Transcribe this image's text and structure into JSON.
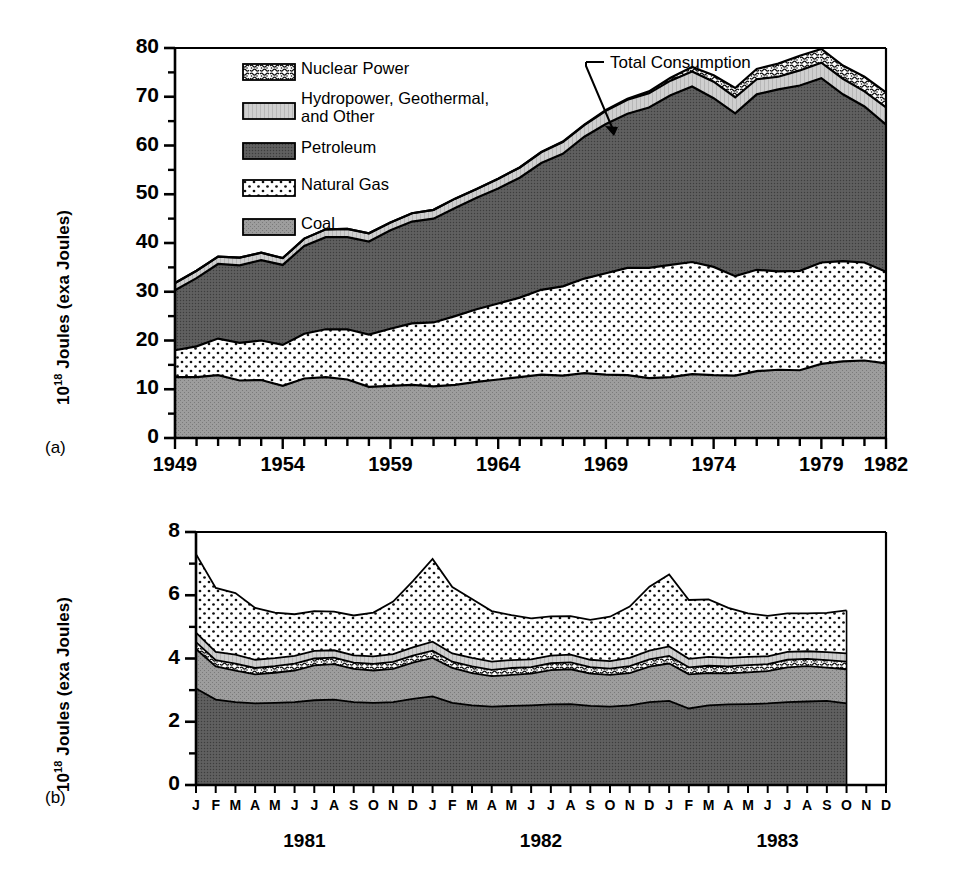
{
  "figure": {
    "panels": [
      {
        "id": "a",
        "label": "(a)"
      },
      {
        "id": "b",
        "label": "(b)"
      }
    ]
  },
  "legend": {
    "items": [
      {
        "key": "nuclear",
        "label": "Nuclear Power",
        "pattern": "speckle",
        "color": "#ffffff"
      },
      {
        "key": "hydro",
        "label": "Hydropower, Geothermal,",
        "label2": "and Other",
        "pattern": "vlines",
        "color": "#d0d0d0"
      },
      {
        "key": "petroleum",
        "label": "Petroleum",
        "pattern": "dense-dark",
        "color": "#555555"
      },
      {
        "key": "gas",
        "label": "Natural Gas",
        "pattern": "dots",
        "color": "#ffffff"
      },
      {
        "key": "coal",
        "label": "Coal",
        "pattern": "mid-gray",
        "color": "#9a9a9a"
      }
    ]
  },
  "annotations": {
    "total_consumption": "Total Consumption"
  },
  "chart_data": [
    {
      "type": "area",
      "panel": "a",
      "title": "",
      "xlabel": "",
      "ylabel": "10¹⁸ Joules (exa Joules)",
      "ylabel_base": "10",
      "ylabel_exp": "18",
      "ylabel_rest": " Joules (exa Joules)",
      "stacked": true,
      "grid": false,
      "legend_position": "upper-left-inside",
      "xlim": [
        1949,
        1982
      ],
      "ylim": [
        0,
        80
      ],
      "ytick_major": [
        0,
        10,
        20,
        30,
        40,
        50,
        60,
        70,
        80
      ],
      "ytick_minor": [
        5,
        15,
        25,
        35,
        45,
        55,
        65,
        75
      ],
      "xtick_labels": [
        "1949",
        "1954",
        "1959",
        "1964",
        "1969",
        "1974",
        "1979",
        "1982"
      ],
      "xtick_label_values": [
        1949,
        1954,
        1959,
        1964,
        1969,
        1974,
        1979,
        1982
      ],
      "x": [
        1949,
        1950,
        1951,
        1952,
        1953,
        1954,
        1955,
        1956,
        1957,
        1958,
        1959,
        1960,
        1961,
        1962,
        1963,
        1964,
        1965,
        1966,
        1967,
        1968,
        1969,
        1970,
        1971,
        1972,
        1973,
        1974,
        1975,
        1976,
        1977,
        1978,
        1979,
        1980,
        1981,
        1982
      ],
      "stack_order_bottom_to_top": [
        "coal",
        "gas",
        "petroleum",
        "hydro",
        "nuclear"
      ],
      "series": [
        {
          "name": "Coal",
          "key": "coal",
          "values": [
            12.5,
            12.5,
            12.9,
            11.8,
            11.9,
            10.7,
            12.2,
            12.5,
            12.0,
            10.5,
            10.7,
            10.9,
            10.6,
            10.9,
            11.5,
            12.0,
            12.5,
            13.0,
            12.8,
            13.3,
            13.0,
            12.9,
            12.3,
            12.5,
            13.1,
            12.9,
            12.8,
            13.7,
            14.0,
            13.9,
            15.2,
            15.7,
            15.9,
            15.3
          ]
        },
        {
          "name": "Natural Gas",
          "key": "gas",
          "values": [
            5.5,
            6.3,
            7.5,
            7.7,
            8.1,
            8.4,
            9.2,
            9.8,
            10.3,
            10.7,
            11.7,
            12.6,
            13.1,
            14.1,
            14.9,
            15.6,
            16.3,
            17.4,
            18.3,
            19.4,
            20.8,
            22.0,
            22.6,
            23.0,
            23.0,
            22.2,
            20.4,
            20.8,
            20.2,
            20.4,
            20.8,
            20.6,
            20.1,
            18.8
          ]
        },
        {
          "name": "Petroleum",
          "key": "petroleum",
          "values": [
            12.3,
            14.0,
            15.3,
            15.9,
            16.5,
            16.4,
            18.0,
            18.9,
            18.9,
            19.1,
            20.2,
            20.9,
            21.3,
            22.2,
            22.9,
            23.6,
            24.6,
            26.0,
            27.2,
            29.1,
            30.6,
            31.6,
            32.9,
            34.8,
            36.0,
            34.6,
            33.4,
            36.0,
            37.3,
            38.0,
            37.8,
            34.2,
            32.0,
            30.2
          ]
        },
        {
          "name": "Hydropower, Geothermal, and Other",
          "key": "hydro",
          "values": [
            1.5,
            1.5,
            1.5,
            1.6,
            1.5,
            1.4,
            1.5,
            1.6,
            1.7,
            1.7,
            1.6,
            1.7,
            1.8,
            1.9,
            1.8,
            2.0,
            2.1,
            2.2,
            2.4,
            2.4,
            2.7,
            2.9,
            2.9,
            3.0,
            3.1,
            3.4,
            3.3,
            3.1,
            2.6,
            3.1,
            3.2,
            3.2,
            3.1,
            3.5
          ]
        },
        {
          "name": "Nuclear Power",
          "key": "nuclear",
          "values": [
            0,
            0,
            0,
            0,
            0,
            0,
            0,
            0,
            0,
            0,
            0,
            0,
            0,
            0,
            0,
            0,
            0,
            0.1,
            0.1,
            0.1,
            0.2,
            0.2,
            0.4,
            0.6,
            0.9,
            1.3,
            1.9,
            2.1,
            2.7,
            3.0,
            2.8,
            2.7,
            3.0,
            3.1
          ]
        }
      ],
      "total_label_series": "Total Consumption"
    },
    {
      "type": "area",
      "panel": "b",
      "title": "",
      "xlabel": "",
      "ylabel": "10¹⁸ Joules (exa Joules)",
      "ylabel_base": "10",
      "ylabel_exp": "18",
      "ylabel_rest": " Joules (exa Joules)",
      "stacked": true,
      "grid": false,
      "ylim": [
        0,
        8
      ],
      "ytick_major": [
        0,
        2,
        4,
        6,
        8
      ],
      "ytick_minor": [
        1,
        3,
        5,
        7
      ],
      "months": [
        "J",
        "F",
        "M",
        "A",
        "M",
        "J",
        "J",
        "A",
        "S",
        "O",
        "N",
        "D"
      ],
      "year_labels": [
        "1981",
        "1982",
        "1983"
      ],
      "x_labels": [
        "J",
        "F",
        "M",
        "A",
        "M",
        "J",
        "J",
        "A",
        "S",
        "O",
        "N",
        "D",
        "J",
        "F",
        "M",
        "A",
        "M",
        "J",
        "J",
        "A",
        "S",
        "O",
        "N",
        "D",
        "J",
        "F",
        "M",
        "A",
        "M",
        "J",
        "J",
        "A",
        "S",
        "O",
        "N",
        "D"
      ],
      "data_points": 34,
      "stack_order_bottom_to_top": [
        "petroleum",
        "coal",
        "nuclear",
        "hydro",
        "gas"
      ],
      "series": [
        {
          "name": "Petroleum",
          "key": "petroleum",
          "values": [
            3.05,
            2.7,
            2.62,
            2.58,
            2.6,
            2.62,
            2.68,
            2.7,
            2.62,
            2.6,
            2.62,
            2.72,
            2.8,
            2.6,
            2.52,
            2.48,
            2.5,
            2.52,
            2.55,
            2.56,
            2.5,
            2.48,
            2.52,
            2.62,
            2.66,
            2.42,
            2.52,
            2.55,
            2.56,
            2.58,
            2.62,
            2.64,
            2.66,
            2.58,
            null,
            null
          ]
        },
        {
          "name": "Coal",
          "key": "coal",
          "values": [
            1.25,
            1.05,
            1.0,
            0.92,
            0.95,
            1.0,
            1.1,
            1.12,
            1.05,
            1.02,
            1.05,
            1.15,
            1.22,
            1.1,
            1.02,
            0.96,
            0.98,
            1.0,
            1.08,
            1.1,
            1.02,
            1.0,
            1.02,
            1.12,
            1.18,
            1.08,
            1.02,
            0.98,
            1.0,
            1.02,
            1.1,
            1.12,
            1.05,
            1.08,
            null,
            null
          ]
        },
        {
          "name": "Nuclear Power",
          "key": "nuclear",
          "values": [
            0.22,
            0.2,
            0.22,
            0.2,
            0.21,
            0.22,
            0.22,
            0.21,
            0.2,
            0.21,
            0.22,
            0.22,
            0.23,
            0.2,
            0.21,
            0.2,
            0.22,
            0.21,
            0.22,
            0.22,
            0.21,
            0.2,
            0.22,
            0.23,
            0.24,
            0.22,
            0.23,
            0.22,
            0.23,
            0.22,
            0.24,
            0.23,
            0.24,
            0.24,
            null,
            null
          ]
        },
        {
          "name": "Hydropower, Geothermal, and Other",
          "key": "hydro",
          "values": [
            0.3,
            0.26,
            0.28,
            0.26,
            0.25,
            0.24,
            0.24,
            0.23,
            0.23,
            0.24,
            0.25,
            0.26,
            0.28,
            0.26,
            0.27,
            0.26,
            0.25,
            0.24,
            0.24,
            0.24,
            0.23,
            0.24,
            0.26,
            0.28,
            0.3,
            0.27,
            0.28,
            0.27,
            0.26,
            0.25,
            0.25,
            0.24,
            0.25,
            0.26,
            null,
            null
          ]
        },
        {
          "name": "Natural Gas",
          "key": "gas",
          "values": [
            2.48,
            2.02,
            1.95,
            1.64,
            1.44,
            1.32,
            1.26,
            1.22,
            1.26,
            1.38,
            1.66,
            2.1,
            2.62,
            2.1,
            1.86,
            1.6,
            1.42,
            1.3,
            1.24,
            1.22,
            1.26,
            1.4,
            1.62,
            2.02,
            2.28,
            1.86,
            1.82,
            1.58,
            1.38,
            1.28,
            1.22,
            1.2,
            1.24,
            1.36,
            null,
            null
          ]
        }
      ]
    }
  ]
}
